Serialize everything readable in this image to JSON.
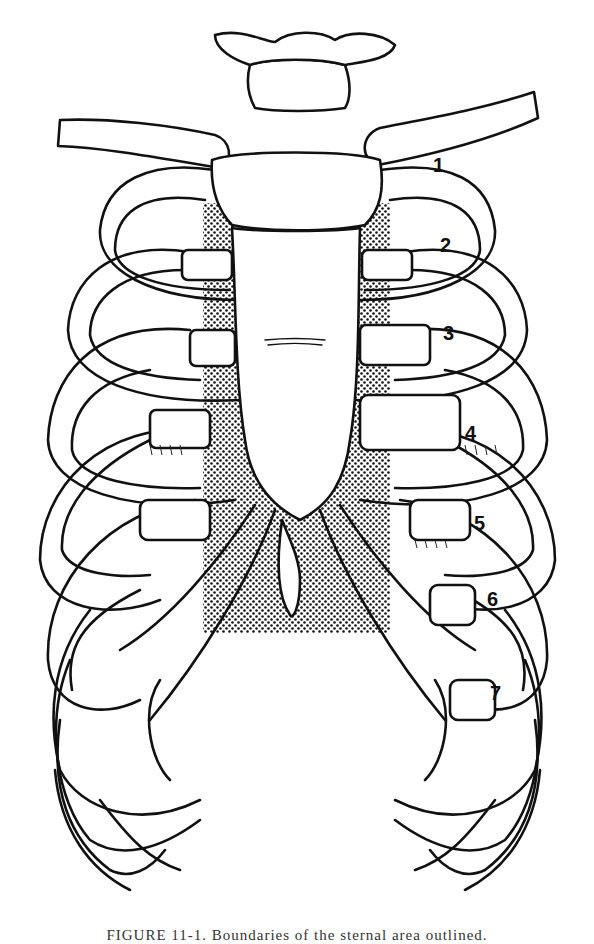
{
  "figure": {
    "shaded_region": {
      "x": 203,
      "y": 203,
      "width": 187,
      "height": 430,
      "pattern": "dot-stipple"
    },
    "rib_labels": [
      {
        "label": "1",
        "x": 437,
        "y": 170
      },
      {
        "label": "2",
        "x": 440,
        "y": 250
      },
      {
        "label": "3",
        "x": 443,
        "y": 338
      },
      {
        "label": "4",
        "x": 465,
        "y": 438
      },
      {
        "label": "5",
        "x": 474,
        "y": 528
      },
      {
        "label": "6",
        "x": 487,
        "y": 604
      },
      {
        "label": "7",
        "x": 490,
        "y": 698
      }
    ]
  },
  "caption": {
    "text": "FIGURE 11-1.  Boundaries of the sternal area outlined."
  }
}
